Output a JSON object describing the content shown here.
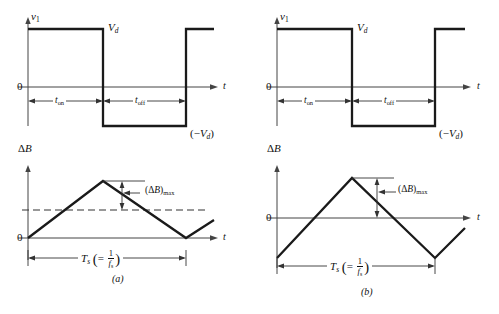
{
  "figure": {
    "panels": [
      {
        "id": "a",
        "caption": "(a)",
        "voltage_plot": {
          "y_axis_label": "v1",
          "x_axis_label": "t",
          "origin_label": "0",
          "high_level_label": "Vd",
          "low_level_label": "(-Vd)",
          "interval_on_label": "ton",
          "interval_off_label": "toff"
        },
        "flux_plot": {
          "y_axis_label": "dB",
          "x_axis_label": "t",
          "origin_label": "0",
          "peak_annotation": "(dB)max",
          "period_label": "Ts",
          "period_equals": "=",
          "period_numerator": "1",
          "period_denominator": "fs",
          "has_dashed_reference": true,
          "waveform": "unipolar-triangle"
        }
      },
      {
        "id": "b",
        "caption": "(b)",
        "voltage_plot": {
          "y_axis_label": "v1",
          "x_axis_label": "t",
          "origin_label": "0",
          "high_level_label": "Vd",
          "low_level_label": "(-Vd)",
          "interval_on_label": "ton",
          "interval_off_label": "toff"
        },
        "flux_plot": {
          "y_axis_label": "dB",
          "x_axis_label": "t",
          "origin_label": "0",
          "peak_annotation": "(dB)max",
          "period_label": "Ts",
          "period_equals": "=",
          "period_numerator": "1",
          "period_denominator": "fs",
          "has_dashed_reference": false,
          "waveform": "bipolar-triangle"
        }
      }
    ],
    "colors": {
      "waveform": "#1a1a1a",
      "axis": "#444444",
      "dashed_reference": "#333333",
      "background": "#ffffff"
    }
  }
}
